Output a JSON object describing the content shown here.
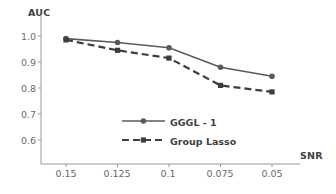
{
  "chart_data": {
    "type": "line",
    "title": "",
    "xlabel": "SNR",
    "ylabel": "AUC",
    "categories": [
      "0.15",
      "0.125",
      "0.1",
      "0.075",
      "0.05"
    ],
    "x_tick_labels": [
      "0.15",
      "0.125",
      "0.1",
      "0.075",
      "0.05"
    ],
    "y_tick_labels": [
      "1.0",
      "0.9",
      "0.8",
      "0.7",
      "0.6"
    ],
    "y_ticks": [
      1.0,
      0.9,
      0.8,
      0.7,
      0.6
    ],
    "ylim": [
      0.55,
      1.03
    ],
    "grid": false,
    "legend_position": "center",
    "series": [
      {
        "name": "GGGL - 1",
        "values": [
          0.99,
          0.975,
          0.955,
          0.88,
          0.845
        ],
        "line_style": "solid",
        "marker": "circle",
        "color": "#5a5a5a"
      },
      {
        "name": "Group Lasso",
        "values": [
          0.985,
          0.945,
          0.915,
          0.81,
          0.785
        ],
        "line_style": "dashed",
        "marker": "square",
        "color": "#3d3d3d"
      }
    ]
  },
  "axes": {
    "y_title": "AUC",
    "x_title": "SNR"
  },
  "legend": {
    "items": [
      {
        "label": "GGGL - 1"
      },
      {
        "label": "Group Lasso"
      }
    ]
  }
}
